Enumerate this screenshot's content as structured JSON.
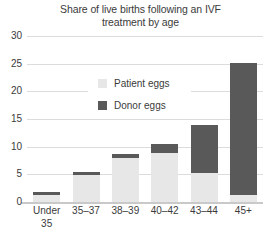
{
  "chart_data": {
    "type": "bar",
    "stacked": true,
    "title": "Share of live births following an IVF treatment by age",
    "title_line1": "Share of live births following an IVF",
    "title_line2": "treatment by age",
    "xlabel": "",
    "ylabel": "",
    "ylim": [
      0,
      30
    ],
    "yticks": [
      30,
      25,
      20,
      15,
      10,
      5,
      0
    ],
    "grid": true,
    "legend_position": "upper-center",
    "categories": [
      "Under 35",
      "35–37",
      "38–39",
      "40–42",
      "43–44",
      "45+"
    ],
    "categories_display": [
      {
        "line1": "Under",
        "line2": "35"
      },
      {
        "line1": "35–37",
        "line2": ""
      },
      {
        "line1": "38–39",
        "line2": ""
      },
      {
        "line1": "40–42",
        "line2": ""
      },
      {
        "line1": "43–44",
        "line2": ""
      },
      {
        "line1": "45+",
        "line2": ""
      }
    ],
    "series": [
      {
        "name": "Patient eggs",
        "color": "#e7e7e7",
        "values": [
          1.2,
          4.9,
          8.0,
          8.8,
          5.2,
          1.2
        ]
      },
      {
        "name": "Donor eggs",
        "color": "#595959",
        "values": [
          0.6,
          0.5,
          0.6,
          1.7,
          8.8,
          24.0
        ]
      }
    ],
    "totals": [
      1.8,
      5.4,
      8.6,
      10.5,
      14.0,
      25.2
    ]
  },
  "legend": {
    "items": [
      {
        "label": "Patient eggs",
        "color": "#e7e7e7"
      },
      {
        "label": "Donor eggs",
        "color": "#595959"
      }
    ]
  },
  "colors": {
    "patient_eggs": "#e7e7e7",
    "donor_eggs": "#595959",
    "gridline": "#dcdcdc",
    "axis": "#c9c9c9",
    "text": "#3b3b3b",
    "background": "#ffffff"
  }
}
